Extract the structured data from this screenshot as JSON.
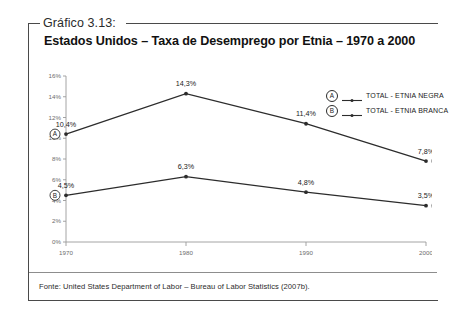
{
  "caption": "Gráfico 3.13:",
  "title": "Estados Unidos – Taxa de Desemprego por Etnia – 1970 a 2000",
  "source": "Fonte: United States Department of Labor – Bureau of Labor Statistics (2007b).",
  "legend": {
    "items": [
      {
        "badge": "A",
        "label": "TOTAL - ETNIA NEGRA"
      },
      {
        "badge": "B",
        "label": "TOTAL - ETNIA BRANCA"
      }
    ]
  },
  "colors": {
    "line": "#2c2c2c",
    "axis": "#9a9a9a",
    "frame": "#4a4a4a",
    "tick_text": "#6d6d6d"
  },
  "chart_data": {
    "type": "line",
    "title": "Estados Unidos – Taxa de Desemprego por Etnia – 1970 a 2000",
    "xlabel": "",
    "ylabel": "",
    "x": [
      1970,
      1980,
      1990,
      2000
    ],
    "categories": [
      "1970",
      "1980",
      "1990",
      "2000"
    ],
    "ylim": [
      0,
      16
    ],
    "ytick_labels": [
      "0%",
      "2%",
      "4%",
      "6%",
      "8%",
      "10%",
      "12%",
      "14%",
      "16%"
    ],
    "ytick_values": [
      0,
      2,
      4,
      6,
      8,
      10,
      12,
      14,
      16
    ],
    "xtick_labels": [
      "1970",
      "1980",
      "1990",
      "2000"
    ],
    "grid": false,
    "legend_position": "top-right",
    "series": [
      {
        "name": "TOTAL - ETNIA NEGRA",
        "badge": "A",
        "values": [
          10.4,
          14.3,
          11.4,
          7.8
        ],
        "data_labels": [
          "10,4%",
          "14,3%",
          "11,4%",
          "7,8%"
        ]
      },
      {
        "name": "TOTAL - ETNIA BRANCA",
        "badge": "B",
        "values": [
          4.5,
          6.3,
          4.8,
          3.5
        ],
        "data_labels": [
          "4,5%",
          "6,3%",
          "4,8%",
          "3,5%"
        ]
      }
    ]
  }
}
